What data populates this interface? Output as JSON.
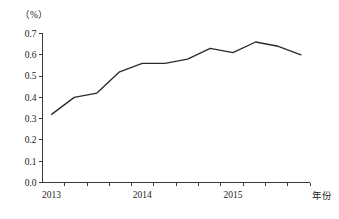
{
  "chart_data": {
    "type": "line",
    "title": "",
    "subtitle": "",
    "xlabel": "年份",
    "ylabel": "",
    "unit_label": "（%）",
    "grid": false,
    "legend": false,
    "legend_position": "none",
    "ylim": [
      0.0,
      0.7
    ],
    "xlim": [
      2012.9,
      2015.85
    ],
    "y_ticks": [
      "0.0",
      "0.1",
      "0.2",
      "0.3",
      "0.4",
      "0.5",
      "0.6",
      "0.7"
    ],
    "y_tick_values": [
      0.0,
      0.1,
      0.2,
      0.3,
      0.4,
      0.5,
      0.6,
      0.7
    ],
    "x_tick_labels": [
      "2013",
      "2014",
      "2015"
    ],
    "x_tick_values": [
      2013,
      2014,
      2015
    ],
    "x_minor_tick_count": 12,
    "x": [
      2013.0,
      2013.25,
      2013.5,
      2013.75,
      2014.0,
      2014.25,
      2014.5,
      2014.75,
      2015.0,
      2015.25,
      2015.5,
      2015.75
    ],
    "values": [
      0.32,
      0.4,
      0.42,
      0.52,
      0.56,
      0.56,
      0.58,
      0.63,
      0.61,
      0.66,
      0.64,
      0.6
    ],
    "series": [
      {
        "name": "比例",
        "color": "#2b2b2b",
        "values": [
          0.32,
          0.4,
          0.42,
          0.52,
          0.56,
          0.56,
          0.58,
          0.63,
          0.61,
          0.66,
          0.64,
          0.6
        ]
      }
    ],
    "annotations": []
  },
  "colors": {
    "line": "#2b2b2b",
    "axis": "#3a3a3a",
    "text": "#1a1a1a",
    "background": "#ffffff"
  }
}
